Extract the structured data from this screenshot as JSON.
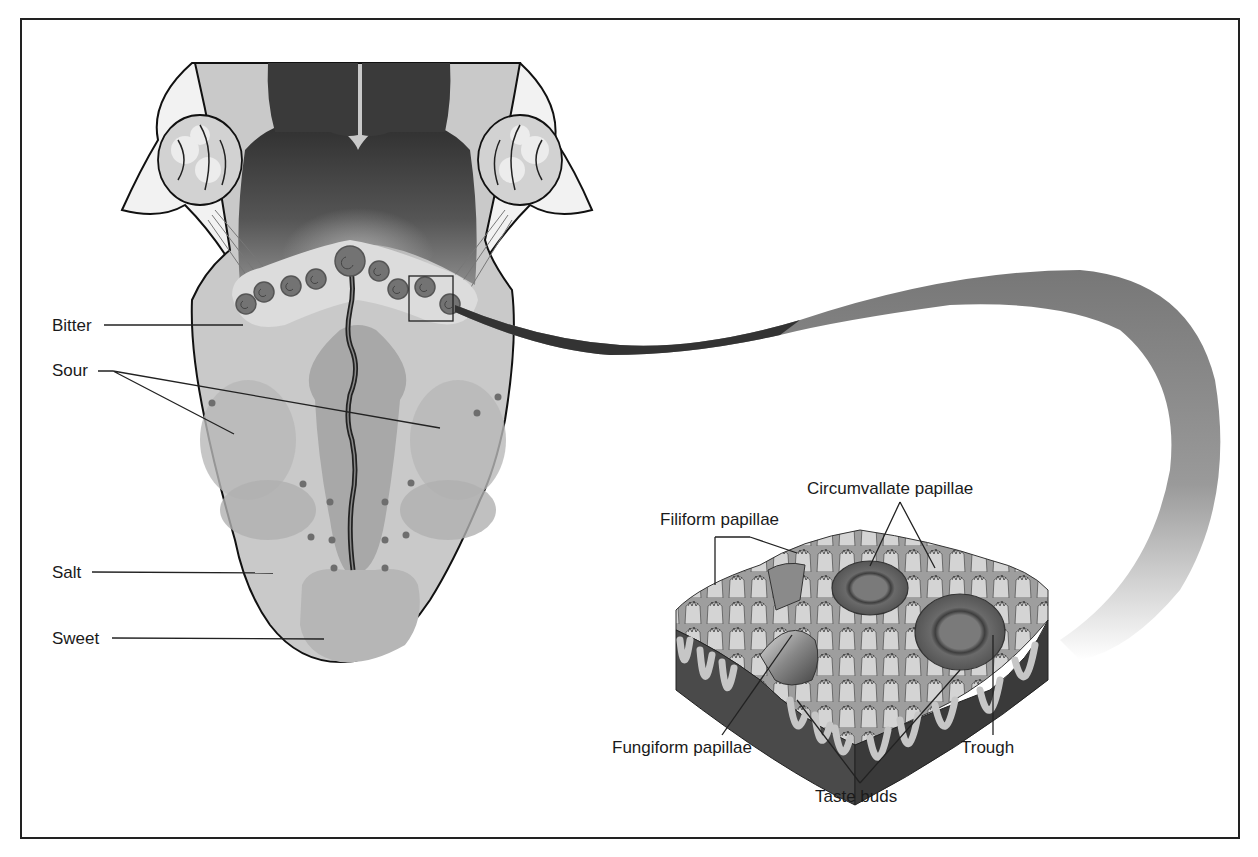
{
  "diagram": {
    "frame_color": "#222222",
    "colors": {
      "tongue_base": "#c9c9c9",
      "tongue_light": "#d9d9d9",
      "zone_mid": "#b3b3b3",
      "zone_dark": "#9a9a9a",
      "throat_dark": "#3a3a3a",
      "papilla_dot": "#6e6e6e",
      "tonsil": "#e6e6e6",
      "outline": "#111111"
    },
    "tongue_labels": {
      "bitter": "Bitter",
      "sour": "Sour",
      "salt": "Salt",
      "sweet": "Sweet"
    },
    "detail_labels": {
      "circumvallate": "Circumvallate papillae",
      "filiform": "Filiform papillae",
      "fungiform": "Fungiform papillae",
      "taste_buds": "Taste buds",
      "trough": "Trough"
    }
  }
}
